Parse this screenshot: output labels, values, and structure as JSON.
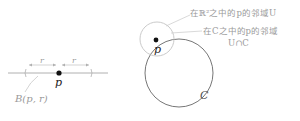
{
  "left_figure": {
    "radius_left_label": "r",
    "radius_right_label": "r",
    "point_label": "p",
    "ball_label": "B(p, r)"
  },
  "right_figure": {
    "point_label": "p",
    "curve_label": "C",
    "annotation_plane_neighborhood": "在ℝ²之中的p的邻域U",
    "annotation_curve_neighborhood_line1": "在C之中的p的邻域",
    "annotation_curve_neighborhood_line2": "U∩C"
  },
  "colors": {
    "line": "#b0b0b0",
    "circle": "#666666",
    "point": "#111111",
    "label": "#9a9a9a"
  }
}
